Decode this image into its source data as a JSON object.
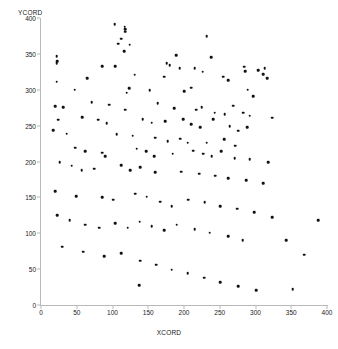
{
  "chart_data": {
    "type": "scatter",
    "title": "",
    "xlabel": "XCORD",
    "ylabel": "YCORD",
    "xlim": [
      0,
      400
    ],
    "ylim": [
      0,
      400
    ],
    "xticks": [
      0,
      50,
      100,
      150,
      200,
      250,
      300,
      350,
      400
    ],
    "yticks": [
      0,
      50,
      100,
      150,
      200,
      250,
      300,
      350,
      400
    ],
    "grid": false,
    "legend": null,
    "marker": {
      "shape": "circle",
      "color": "#111111",
      "size": 2.6
    },
    "axis_color": "#b9b9b9",
    "n_points": 147,
    "points": [
      [
        103,
        391
      ],
      [
        117,
        388
      ],
      [
        118,
        384
      ],
      [
        118,
        381
      ],
      [
        112,
        371
      ],
      [
        108,
        364
      ],
      [
        124,
        363
      ],
      [
        116,
        354
      ],
      [
        232,
        375
      ],
      [
        22,
        347
      ],
      [
        23,
        340
      ],
      [
        22,
        337
      ],
      [
        86,
        333
      ],
      [
        104,
        333
      ],
      [
        189,
        348
      ],
      [
        176,
        337
      ],
      [
        180,
        334
      ],
      [
        194,
        330
      ],
      [
        215,
        330
      ],
      [
        226,
        325
      ],
      [
        238,
        345
      ],
      [
        284,
        332
      ],
      [
        286,
        326
      ],
      [
        304,
        327
      ],
      [
        313,
        330
      ],
      [
        311,
        322
      ],
      [
        316,
        316
      ],
      [
        172,
        318
      ],
      [
        22,
        311
      ],
      [
        65,
        316
      ],
      [
        131,
        321
      ],
      [
        255,
        318
      ],
      [
        262,
        313
      ],
      [
        47,
        300
      ],
      [
        123,
        302
      ],
      [
        120,
        296
      ],
      [
        152,
        299
      ],
      [
        200,
        298
      ],
      [
        210,
        303
      ],
      [
        289,
        300
      ],
      [
        297,
        291
      ],
      [
        20,
        277
      ],
      [
        31,
        276
      ],
      [
        71,
        283
      ],
      [
        95,
        279
      ],
      [
        118,
        272
      ],
      [
        163,
        281
      ],
      [
        186,
        274
      ],
      [
        217,
        272
      ],
      [
        225,
        276
      ],
      [
        243,
        268
      ],
      [
        241,
        259
      ],
      [
        257,
        266
      ],
      [
        269,
        278
      ],
      [
        283,
        268
      ],
      [
        292,
        264
      ],
      [
        323,
        261
      ],
      [
        24,
        258
      ],
      [
        58,
        262
      ],
      [
        80,
        258
      ],
      [
        92,
        253
      ],
      [
        142,
        259
      ],
      [
        155,
        254
      ],
      [
        174,
        256
      ],
      [
        199,
        259
      ],
      [
        210,
        252
      ],
      [
        223,
        248
      ],
      [
        264,
        249
      ],
      [
        276,
        243
      ],
      [
        288,
        248
      ],
      [
        17,
        244
      ],
      [
        36,
        239
      ],
      [
        106,
        238
      ],
      [
        128,
        236
      ],
      [
        160,
        233
      ],
      [
        177,
        228
      ],
      [
        195,
        232
      ],
      [
        205,
        226
      ],
      [
        232,
        226
      ],
      [
        256,
        231
      ],
      [
        272,
        222
      ],
      [
        48,
        219
      ],
      [
        62,
        214
      ],
      [
        86,
        212
      ],
      [
        90,
        207
      ],
      [
        134,
        218
      ],
      [
        147,
        214
      ],
      [
        158,
        207
      ],
      [
        184,
        211
      ],
      [
        213,
        215
      ],
      [
        227,
        211
      ],
      [
        239,
        207
      ],
      [
        252,
        214
      ],
      [
        271,
        205
      ],
      [
        292,
        203
      ],
      [
        318,
        199
      ],
      [
        26,
        199
      ],
      [
        43,
        194
      ],
      [
        57,
        188
      ],
      [
        74,
        190
      ],
      [
        112,
        195
      ],
      [
        125,
        188
      ],
      [
        139,
        192
      ],
      [
        160,
        185
      ],
      [
        196,
        186
      ],
      [
        221,
        183
      ],
      [
        244,
        180
      ],
      [
        262,
        177
      ],
      [
        287,
        174
      ],
      [
        311,
        170
      ],
      [
        20,
        159
      ],
      [
        49,
        152
      ],
      [
        86,
        150
      ],
      [
        101,
        147
      ],
      [
        132,
        155
      ],
      [
        148,
        151
      ],
      [
        167,
        144
      ],
      [
        183,
        138
      ],
      [
        206,
        147
      ],
      [
        229,
        143
      ],
      [
        251,
        138
      ],
      [
        274,
        134
      ],
      [
        298,
        129
      ],
      [
        323,
        122
      ],
      [
        23,
        125
      ],
      [
        40,
        118
      ],
      [
        62,
        112
      ],
      [
        81,
        108
      ],
      [
        104,
        114
      ],
      [
        121,
        108
      ],
      [
        138,
        116
      ],
      [
        155,
        110
      ],
      [
        172,
        104
      ],
      [
        190,
        112
      ],
      [
        215,
        106
      ],
      [
        236,
        101
      ],
      [
        262,
        96
      ],
      [
        282,
        90
      ],
      [
        30,
        81
      ],
      [
        59,
        74
      ],
      [
        88,
        68
      ],
      [
        112,
        72
      ],
      [
        139,
        62
      ],
      [
        161,
        56
      ],
      [
        183,
        49
      ],
      [
        205,
        44
      ],
      [
        228,
        38
      ],
      [
        251,
        32
      ],
      [
        276,
        26
      ],
      [
        301,
        21
      ],
      [
        137,
        28
      ],
      [
        343,
        90
      ],
      [
        352,
        22
      ],
      [
        368,
        70
      ],
      [
        388,
        118
      ]
    ]
  },
  "axes": {
    "x_axis_title": "XCORD",
    "y_axis_title": "YCORD",
    "x_tick_labels": [
      "0",
      "50",
      "100",
      "150",
      "200",
      "250",
      "300",
      "350",
      "400"
    ],
    "y_tick_labels": [
      "0",
      "50",
      "100",
      "150",
      "200",
      "250",
      "300",
      "350",
      "400"
    ]
  }
}
